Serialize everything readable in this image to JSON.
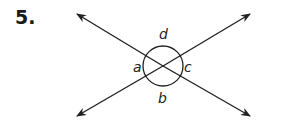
{
  "problem": {
    "number": "5."
  },
  "figure": {
    "stroke_color": "#222222",
    "intersection": {
      "x": 163,
      "y": 66
    },
    "circle_radius": 20,
    "lines": [
      {
        "name": "line-1",
        "from": {
          "x": 77,
          "y": 14
        },
        "to": {
          "x": 250,
          "y": 116
        }
      },
      {
        "name": "line-2",
        "from": {
          "x": 77,
          "y": 116
        },
        "to": {
          "x": 250,
          "y": 14
        }
      }
    ],
    "angles": [
      {
        "label": "a",
        "position": "left"
      },
      {
        "label": "b",
        "position": "bottom"
      },
      {
        "label": "c",
        "position": "right"
      },
      {
        "label": "d",
        "position": "top"
      }
    ]
  }
}
